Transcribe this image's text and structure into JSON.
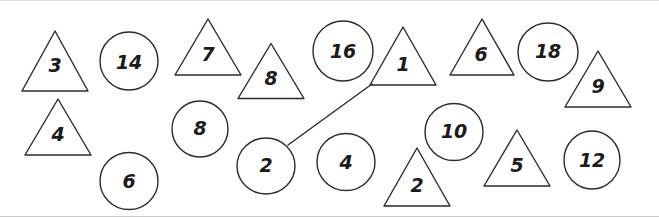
{
  "figure": {
    "width": 659,
    "height": 217,
    "background_color": "#ffffff",
    "border_color": "#dcdcdc",
    "stroke_color": "#2b2b2b",
    "label_color": "#1b1b1b"
  },
  "shapes": [
    {
      "id": "triangle-3",
      "type": "triangle",
      "label": "3",
      "cx": 55,
      "cy": 60,
      "w": 66,
      "h": 60,
      "label_x": 55,
      "label_y": 64
    },
    {
      "id": "circle-14",
      "type": "circle",
      "label": "14",
      "cx": 129,
      "cy": 60,
      "w": 58,
      "h": 58,
      "label_x": 129,
      "label_y": 61
    },
    {
      "id": "triangle-7",
      "type": "triangle",
      "label": "7",
      "cx": 208,
      "cy": 46,
      "w": 66,
      "h": 56,
      "label_x": 208,
      "label_y": 53
    },
    {
      "id": "triangle-8",
      "type": "triangle",
      "label": "8",
      "cx": 271,
      "cy": 70,
      "w": 66,
      "h": 55,
      "label_x": 271,
      "label_y": 77
    },
    {
      "id": "circle-16",
      "type": "circle",
      "label": "16",
      "cx": 343,
      "cy": 50,
      "w": 60,
      "h": 60,
      "label_x": 343,
      "label_y": 50
    },
    {
      "id": "triangle-1",
      "type": "triangle",
      "label": "1",
      "cx": 403,
      "cy": 55,
      "w": 66,
      "h": 58,
      "label_x": 403,
      "label_y": 63
    },
    {
      "id": "triangle-6",
      "type": "triangle",
      "label": "6",
      "cx": 482,
      "cy": 46,
      "w": 64,
      "h": 56,
      "label_x": 481,
      "label_y": 53
    },
    {
      "id": "circle-18",
      "type": "circle",
      "label": "18",
      "cx": 548,
      "cy": 51,
      "w": 60,
      "h": 58,
      "label_x": 548,
      "label_y": 50
    },
    {
      "id": "triangle-9",
      "type": "triangle",
      "label": "9",
      "cx": 598,
      "cy": 78,
      "w": 66,
      "h": 56,
      "label_x": 598,
      "label_y": 85
    },
    {
      "id": "triangle-4",
      "type": "triangle",
      "label": "4",
      "cx": 58,
      "cy": 126,
      "w": 66,
      "h": 56,
      "label_x": 58,
      "label_y": 133
    },
    {
      "id": "circle-8",
      "type": "circle",
      "label": "8",
      "cx": 200,
      "cy": 128,
      "w": 56,
      "h": 56,
      "label_x": 200,
      "label_y": 127
    },
    {
      "id": "circle-6",
      "type": "circle",
      "label": "6",
      "cx": 129,
      "cy": 180,
      "w": 58,
      "h": 57,
      "label_x": 129,
      "label_y": 180
    },
    {
      "id": "circle-2",
      "type": "circle",
      "label": "2",
      "cx": 266,
      "cy": 165,
      "w": 58,
      "h": 56,
      "label_x": 266,
      "label_y": 164
    },
    {
      "id": "circle-4",
      "type": "circle",
      "label": "4",
      "cx": 346,
      "cy": 161,
      "w": 58,
      "h": 57,
      "label_x": 346,
      "label_y": 161
    },
    {
      "id": "triangle-2",
      "type": "triangle",
      "label": "2",
      "cx": 417,
      "cy": 176,
      "w": 66,
      "h": 58,
      "label_x": 417,
      "label_y": 184
    },
    {
      "id": "circle-10",
      "type": "circle",
      "label": "10",
      "cx": 454,
      "cy": 131,
      "w": 58,
      "h": 57,
      "label_x": 454,
      "label_y": 130
    },
    {
      "id": "triangle-5",
      "type": "triangle",
      "label": "5",
      "cx": 517,
      "cy": 157,
      "w": 66,
      "h": 56,
      "label_x": 517,
      "label_y": 164
    },
    {
      "id": "circle-12",
      "type": "circle",
      "label": "12",
      "cx": 592,
      "cy": 159,
      "w": 56,
      "h": 58,
      "label_x": 592,
      "label_y": 159
    }
  ],
  "connections": [
    {
      "id": "edge-2-to-1",
      "from": "circle-2",
      "to": "triangle-1",
      "x1": 288,
      "y1": 144,
      "x2": 372,
      "y2": 83
    }
  ]
}
